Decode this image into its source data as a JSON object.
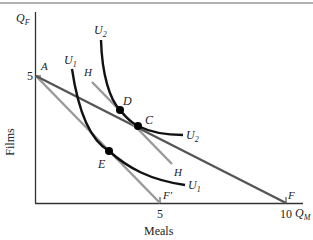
{
  "diagram": {
    "title": "",
    "axes": {
      "y_symbol": "Q",
      "y_sub": "F",
      "x_symbol": "Q",
      "x_sub": "M",
      "y_label": "Films",
      "x_label": "Meals",
      "y_tick": "5",
      "x_ticks": [
        "5",
        "10"
      ]
    },
    "points": {
      "A": "A",
      "C": "C",
      "D": "D",
      "E": "E",
      "F": "F",
      "F_prime": "F′"
    },
    "curves": {
      "U1_top": "U",
      "U1_top_sub": "1",
      "U1_end": "U",
      "U1_end_sub": "1",
      "U2_top": "U",
      "U2_top_sub": "2",
      "U2_end": "U",
      "U2_end_sub": "2",
      "H_top": "H",
      "H_end": "H"
    },
    "colors": {
      "axis": "#333333",
      "budget_AF": "#555555",
      "budget_AFprime": "#999999",
      "line_H": "#999999",
      "indifference": "#111111"
    }
  }
}
